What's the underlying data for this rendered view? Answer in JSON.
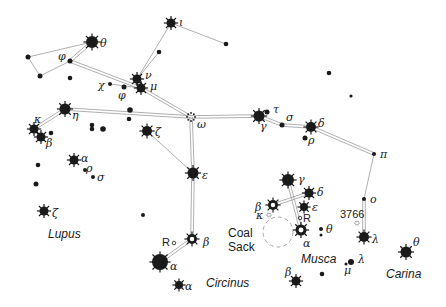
{
  "colors": {
    "ink": "#1a1a1a",
    "line": "#9a9a9a",
    "dash": "#aaaaaa",
    "background": "#ffffff"
  },
  "regions": [
    {
      "id": "lupus",
      "label": "Lupus",
      "x": 48,
      "y": 238
    },
    {
      "id": "circinus",
      "label": "Circinus",
      "x": 206,
      "y": 287
    },
    {
      "id": "musca",
      "label": "Musca",
      "x": 301,
      "y": 263
    },
    {
      "id": "carina",
      "label": "Carina",
      "x": 386,
      "y": 278
    },
    {
      "id": "coal-sack-1",
      "label": "Coal",
      "x": 228,
      "y": 237
    },
    {
      "id": "coal-sack-2",
      "label": "Sack",
      "x": 228,
      "y": 251
    }
  ],
  "annotations": [
    {
      "id": "ngc-3766",
      "label": "3766",
      "x": 340,
      "y": 218
    },
    {
      "id": "r-centauri",
      "label": "R",
      "x": 162,
      "y": 246
    },
    {
      "id": "r-muscae",
      "label": "R",
      "x": 303,
      "y": 222
    }
  ],
  "stars": [
    {
      "id": "theta-cen",
      "label": "θ",
      "x": 92,
      "y": 42,
      "r": 6,
      "type": "bright",
      "lx": 100,
      "ly": 47
    },
    {
      "id": "iota-cen",
      "label": "ι",
      "x": 171,
      "y": 23,
      "r": 4.5,
      "type": "bright",
      "lx": 179,
      "ly": 26
    },
    {
      "id": "phi-cen",
      "label": "φ",
      "x": 70,
      "y": 61,
      "r": 2.5,
      "type": "dot",
      "lx": 58,
      "ly": 60
    },
    {
      "id": "nu-cen",
      "label": "ν",
      "x": 137,
      "y": 79,
      "r": 4.5,
      "type": "bright",
      "lx": 145,
      "ly": 79
    },
    {
      "id": "mu-cen",
      "label": "μ",
      "x": 141,
      "y": 88,
      "r": 4.5,
      "type": "bright",
      "lx": 150,
      "ly": 90
    },
    {
      "id": "chi-cen",
      "label": "χ",
      "x": 110,
      "y": 84,
      "r": 2,
      "type": "dot",
      "lx": 98,
      "ly": 89
    },
    {
      "id": "psi-cen",
      "label": "φ",
      "x": 124,
      "y": 87,
      "r": 2.5,
      "type": "dot",
      "lx": 118,
      "ly": 99
    },
    {
      "id": "eta-cen",
      "label": "η",
      "x": 65,
      "y": 109,
      "r": 5.5,
      "type": "bright",
      "lx": 72,
      "ly": 119
    },
    {
      "id": "kappa-cen",
      "label": "κ",
      "x": 34,
      "y": 129,
      "r": 4.5,
      "type": "bright",
      "lx": 34,
      "ly": 123
    },
    {
      "id": "beta-lup",
      "label": "β",
      "x": 41,
      "y": 137,
      "r": 4.5,
      "type": "bright",
      "lx": 46,
      "ly": 147
    },
    {
      "id": "zeta-cen",
      "label": "ζ",
      "x": 147,
      "y": 131,
      "r": 5,
      "type": "bright",
      "lx": 155,
      "ly": 136
    },
    {
      "id": "omega-cen",
      "label": "ω",
      "x": 191,
      "y": 117,
      "r": 4,
      "type": "cluster",
      "lx": 197,
      "ly": 128
    },
    {
      "id": "gamma-cen",
      "label": "γ",
      "x": 259,
      "y": 116,
      "r": 5.5,
      "type": "bright",
      "lx": 260,
      "ly": 130
    },
    {
      "id": "tau-cen",
      "label": "τ",
      "x": 267,
      "y": 112,
      "r": 2.5,
      "type": "dot",
      "lx": 273,
      "ly": 113
    },
    {
      "id": "sigma-cen",
      "label": "σ",
      "x": 282,
      "y": 125,
      "r": 2.5,
      "type": "dot",
      "lx": 286,
      "ly": 121
    },
    {
      "id": "delta-cen",
      "label": "δ",
      "x": 311,
      "y": 127,
      "r": 5,
      "type": "bright",
      "lx": 318,
      "ly": 127
    },
    {
      "id": "rho-cen",
      "label": "ρ",
      "x": 305,
      "y": 138,
      "r": 2.5,
      "type": "dot",
      "lx": 308,
      "ly": 144
    },
    {
      "id": "pi-cen",
      "label": "π",
      "x": 374,
      "y": 154,
      "r": 2,
      "type": "dot",
      "lx": 380,
      "ly": 158
    },
    {
      "id": "o-cen",
      "label": "o",
      "x": 364,
      "y": 199,
      "r": 2,
      "type": "dot",
      "lx": 370,
      "ly": 203
    },
    {
      "id": "lambda-cen",
      "label": "λ",
      "x": 364,
      "y": 237,
      "r": 5,
      "type": "bright",
      "lx": 372,
      "ly": 243
    },
    {
      "id": "epsilon-cen",
      "label": "ε",
      "x": 193,
      "y": 173,
      "r": 5.5,
      "type": "bright",
      "lx": 202,
      "ly": 179
    },
    {
      "id": "beta-cen",
      "label": "β",
      "x": 192,
      "y": 239,
      "r": 5,
      "type": "ring",
      "lx": 203,
      "ly": 246
    },
    {
      "id": "alpha-cen",
      "label": "α",
      "x": 160,
      "y": 262,
      "r": 8,
      "type": "bright",
      "lx": 170,
      "ly": 270
    },
    {
      "id": "alpha-cir",
      "label": "α",
      "x": 179,
      "y": 285,
      "r": 4,
      "type": "bright",
      "lx": 185,
      "ly": 290
    },
    {
      "id": "alpha-lup",
      "label": "α",
      "x": 74,
      "y": 160,
      "r": 4.5,
      "type": "bright",
      "lx": 81,
      "ly": 162
    },
    {
      "id": "rho-lup",
      "label": "ρ",
      "x": 85,
      "y": 170,
      "r": 2,
      "type": "dot",
      "lx": 86,
      "ly": 172
    },
    {
      "id": "sigma-lup",
      "label": "σ",
      "x": 93,
      "y": 177,
      "r": 2,
      "type": "dot",
      "lx": 97,
      "ly": 181
    },
    {
      "id": "zeta-lup",
      "label": "ζ",
      "x": 44,
      "y": 211,
      "r": 4.5,
      "type": "bright",
      "lx": 52,
      "ly": 217
    },
    {
      "id": "gamma-cru",
      "label": "γ",
      "x": 288,
      "y": 180,
      "r": 6,
      "type": "bright",
      "lx": 298,
      "ly": 183
    },
    {
      "id": "delta-cru",
      "label": "δ",
      "x": 309,
      "y": 193,
      "r": 4.5,
      "type": "bright",
      "lx": 317,
      "ly": 196
    },
    {
      "id": "epsilon-cru",
      "label": "ε",
      "x": 304,
      "y": 207,
      "r": 4,
      "type": "bright",
      "lx": 312,
      "ly": 211
    },
    {
      "id": "beta-cru",
      "label": "β",
      "x": 273,
      "y": 205,
      "r": 5,
      "type": "ring",
      "lx": 255,
      "ly": 211
    },
    {
      "id": "kappa-cru",
      "label": "κ",
      "x": 269,
      "y": 215,
      "r": 2,
      "type": "cluster-small",
      "lx": 256,
      "ly": 219
    },
    {
      "id": "alpha-cru",
      "label": "α",
      "x": 301,
      "y": 230,
      "r": 5.5,
      "type": "ring",
      "lx": 303,
      "ly": 247
    },
    {
      "id": "theta-cru",
      "label": "θ",
      "x": 321,
      "y": 229,
      "r": 2,
      "type": "dot",
      "lx": 326,
      "ly": 233
    },
    {
      "id": "beta-mus",
      "label": "β",
      "x": 296,
      "y": 281,
      "r": 4.5,
      "type": "bright",
      "lx": 285,
      "ly": 276
    },
    {
      "id": "lambda-mus",
      "label": "λ",
      "x": 351,
      "y": 262,
      "r": 3,
      "type": "dot",
      "lx": 358,
      "ly": 263
    },
    {
      "id": "mu-mus",
      "label": "μ",
      "x": 346,
      "y": 264,
      "r": 1.5,
      "type": "dot",
      "lx": 344,
      "ly": 274
    },
    {
      "id": "theta-car",
      "label": "θ",
      "x": 406,
      "y": 252,
      "r": 5.5,
      "type": "bright",
      "lx": 413,
      "ly": 246
    },
    {
      "id": "ngc-3766",
      "label": "",
      "x": 357,
      "y": 223,
      "r": 2,
      "type": "cluster-small"
    },
    {
      "id": "r-mus-mark",
      "label": "",
      "x": 300,
      "y": 218,
      "r": 1.8,
      "type": "open"
    },
    {
      "id": "r-cen-mark",
      "label": "",
      "x": 174,
      "y": 243,
      "r": 1.8,
      "type": "open"
    }
  ],
  "field_dots": [
    {
      "x": 28,
      "y": 57,
      "r": 2.5
    },
    {
      "x": 40,
      "y": 76,
      "r": 2.5
    },
    {
      "x": 70,
      "y": 78,
      "r": 2.3
    },
    {
      "x": 159,
      "y": 52,
      "r": 2.3
    },
    {
      "x": 226,
      "y": 44,
      "r": 2.3
    },
    {
      "x": 329,
      "y": 73,
      "r": 2.3
    },
    {
      "x": 351,
      "y": 96,
      "r": 1.6
    },
    {
      "x": 130,
      "y": 110,
      "r": 2.8
    },
    {
      "x": 129,
      "y": 119,
      "r": 2.3
    },
    {
      "x": 92,
      "y": 125,
      "r": 2.3
    },
    {
      "x": 92,
      "y": 129,
      "r": 2.3
    },
    {
      "x": 103,
      "y": 129,
      "r": 2.8
    },
    {
      "x": 51,
      "y": 133,
      "r": 2.3
    },
    {
      "x": 38,
      "y": 165,
      "r": 2.3
    },
    {
      "x": 36,
      "y": 184,
      "r": 2.5
    },
    {
      "x": 143,
      "y": 215,
      "r": 2
    },
    {
      "x": 321,
      "y": 235,
      "r": 1.5
    },
    {
      "x": 322,
      "y": 274,
      "r": 2.3
    }
  ],
  "lines": [
    {
      "from": "theta-cen",
      "to": "phi-cen",
      "style": "double"
    },
    {
      "from": "phi-cen",
      "to": "mu-cen",
      "style": "double"
    },
    {
      "from": "mu-cen",
      "to": "omega-cen",
      "style": "double"
    },
    {
      "from": "omega-cen",
      "to": "gamma-cen",
      "style": "double"
    },
    {
      "from": "gamma-cen",
      "to": "sigma-cen",
      "style": "double"
    },
    {
      "from": "sigma-cen",
      "to": "delta-cen",
      "style": "double"
    },
    {
      "from": "delta-cen",
      "to": "pi-cen",
      "style": "double"
    },
    {
      "from": "pi-cen",
      "to": "o-cen",
      "style": "single"
    },
    {
      "from": "o-cen",
      "to": "lambda-cen",
      "style": "double"
    },
    {
      "from": "omega-cen",
      "to": "eta-cen",
      "style": "double"
    },
    {
      "from": "eta-cen",
      "to": "kappa-cen",
      "style": "double"
    },
    {
      "from": "omega-cen",
      "to": "epsilon-cen",
      "style": "double"
    },
    {
      "from": "epsilon-cen",
      "to": "beta-cen",
      "style": "double"
    },
    {
      "from": "beta-cen",
      "to": "alpha-cen",
      "style": "double"
    },
    {
      "from": "zeta-cen",
      "to": "epsilon-cen",
      "style": "single"
    },
    {
      "from": "nu-cen",
      "to": "iota-cen",
      "style": "single"
    },
    {
      "from": "nu-cen",
      "to": "mu-cen",
      "style": "single"
    },
    {
      "from": "chi-cen",
      "to": "mu-cen",
      "style": "single"
    },
    {
      "from": "theta-cen",
      "to": "f1",
      "style": "single"
    },
    {
      "from": "gamma-cru",
      "to": "alpha-cru",
      "style": "double"
    },
    {
      "from": "beta-cru",
      "to": "delta-cru",
      "style": "double"
    }
  ],
  "polyline_single": [
    [
      [
        92,
        42
      ],
      [
        28,
        57
      ],
      [
        40,
        76
      ],
      [
        70,
        61
      ]
    ],
    [
      [
        171,
        23
      ],
      [
        226,
        44
      ]
    ],
    [
      [
        159,
        52
      ],
      [
        137,
        79
      ]
    ]
  ],
  "coal_sack": {
    "cx": 278,
    "cy": 232,
    "r": 15
  }
}
